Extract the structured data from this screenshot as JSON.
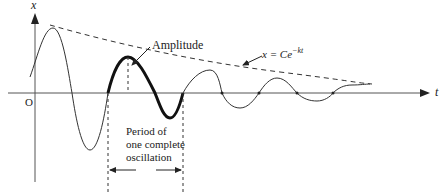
{
  "figure": {
    "axes": {
      "y_label": "x",
      "x_label": "t",
      "origin_label": "O"
    },
    "annotations": {
      "amplitude": "Amplitude",
      "envelope_lhs": "x = Ce",
      "envelope_exp": "−kt",
      "period_lines": [
        "Period of",
        "one complete",
        "oscillation"
      ]
    },
    "colors": {
      "ink": "#222222",
      "axis": "#555555",
      "background": "#ffffff"
    }
  }
}
